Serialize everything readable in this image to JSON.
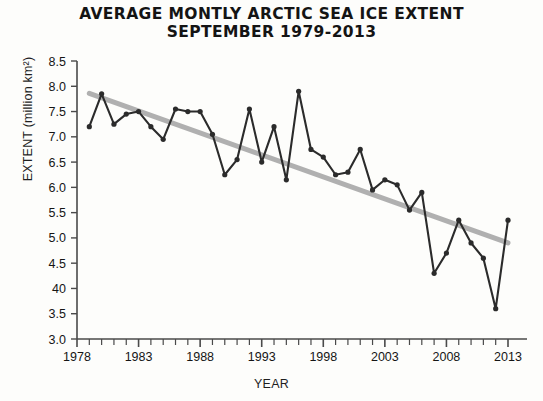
{
  "chart_data": {
    "type": "line",
    "title": "AVERAGE MONTLY ARCTIC SEA ICE EXTENT",
    "subtitle": "SEPTEMBER 1979-2013",
    "xlabel": "YEAR",
    "ylabel": "EXTENT (million km²)",
    "xlim": [
      1978,
      2013.5
    ],
    "ylim": [
      3.0,
      8.5
    ],
    "grid": false,
    "legend": null,
    "x_tick_labels": [
      "1978",
      "1983",
      "1988",
      "1993",
      "1998",
      "2003",
      "2008",
      "2013"
    ],
    "x_tick_values": [
      1978,
      1983,
      1988,
      1993,
      1998,
      2003,
      2008,
      2013
    ],
    "x_minor_tick_step": 1,
    "y_tick_labels": [
      "8.5",
      "8.0",
      "7.5",
      "7.0",
      "6.5",
      "6.0",
      "5.5",
      "5.0",
      "4.5",
      "40",
      "3.5",
      "3.0"
    ],
    "y_tick_values": [
      8.5,
      8.0,
      7.5,
      7.0,
      6.5,
      6.0,
      5.5,
      5.0,
      4.5,
      4.0,
      3.5,
      3.0
    ],
    "x": [
      1979,
      1980,
      1981,
      1982,
      1983,
      1984,
      1985,
      1986,
      1987,
      1988,
      1989,
      1990,
      1991,
      1992,
      1993,
      1994,
      1995,
      1996,
      1997,
      1998,
      1999,
      2000,
      2001,
      2002,
      2003,
      2004,
      2005,
      2006,
      2007,
      2008,
      2009,
      2010,
      2011,
      2012,
      2013
    ],
    "series": [
      {
        "name": "September sea ice extent",
        "color": "#2b2b2b",
        "marker": "circle",
        "values": [
          7.2,
          7.85,
          7.25,
          7.45,
          7.5,
          7.2,
          6.95,
          7.55,
          7.5,
          7.5,
          7.05,
          6.25,
          6.55,
          7.55,
          6.5,
          7.2,
          6.15,
          7.9,
          6.75,
          6.6,
          6.25,
          6.3,
          6.75,
          5.95,
          6.15,
          6.05,
          5.55,
          5.9,
          4.3,
          4.7,
          5.35,
          4.9,
          4.6,
          3.6,
          5.35
        ]
      },
      {
        "name": "Linear trend",
        "color": "#b0b0b0",
        "marker": "none",
        "type": "trendline",
        "endpoints": [
          [
            1979,
            7.86
          ],
          [
            2013,
            4.9
          ]
        ]
      }
    ]
  },
  "axis": {
    "x_title": "YEAR",
    "y_title": "EXTENT (million km²)"
  },
  "header": {
    "title_line_1": "AVERAGE MONTLY ARCTIC SEA ICE EXTENT",
    "title_line_2": "SEPTEMBER 1979-2013"
  }
}
